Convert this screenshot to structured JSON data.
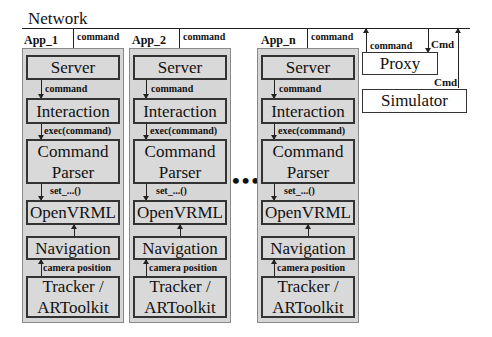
{
  "network": {
    "label": "Network"
  },
  "apps": [
    {
      "label": "App_1",
      "incoming_edge": "command",
      "components": [
        "Server",
        "Interaction",
        "Command Parser",
        "OpenVRML",
        "Navigation",
        "Tracker / ARToolkit"
      ],
      "edges": [
        "command",
        "exec(command)",
        "set_...()",
        "",
        "camera position"
      ]
    },
    {
      "label": "App_2",
      "incoming_edge": "command",
      "components": [
        "Server",
        "Interaction",
        "Command Parser",
        "OpenVRML",
        "Navigation",
        "Tracker / ARToolkit"
      ],
      "edges": [
        "command",
        "exec(command)",
        "set_...()",
        "",
        "camera position"
      ]
    },
    {
      "label": "App_n",
      "incoming_edge": "command",
      "components": [
        "Server",
        "Interaction",
        "Command Parser",
        "OpenVRML",
        "Navigation",
        "Tracker / ARToolkit"
      ],
      "edges": [
        "command",
        "exec(command)",
        "set_...()",
        "",
        "camera position"
      ]
    }
  ],
  "ellipsis": "•••",
  "proxy": {
    "label": "Proxy",
    "out_edge": "command",
    "in_edge": "Cmd"
  },
  "simulator": {
    "label": "Simulator",
    "out_edge": "Cmd"
  },
  "colors": {
    "component_fill": "#d9d9d9",
    "container_fill": "#d6d6d6",
    "line": "#222222"
  }
}
